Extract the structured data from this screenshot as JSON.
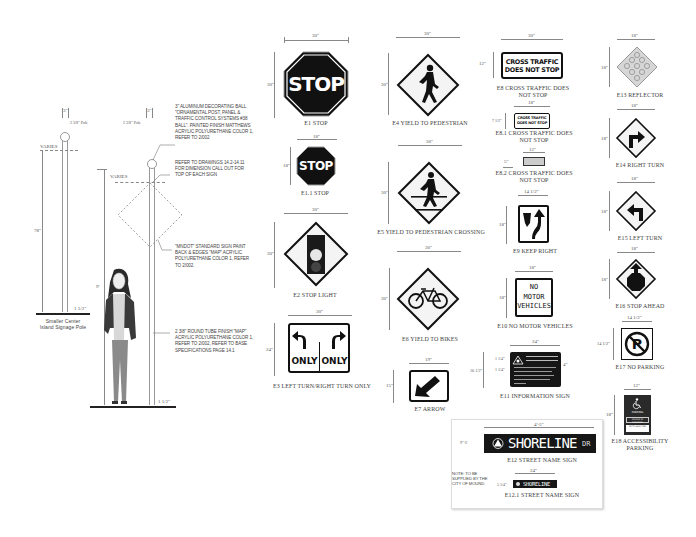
{
  "poles": {
    "small_pole": {
      "top_dim": "3\"",
      "pole_label": "2 3/8\" Pole",
      "varies": "VARIES",
      "height": "78\"",
      "base_dim": "1 1/2\"",
      "caption_line1": "Smaller Center",
      "caption_line2": "Island Signage Pole"
    },
    "large_pole": {
      "top_dim": "3\"",
      "pole_label": "2 3/8\" Pole",
      "varies": "VARIES",
      "side_dim": "9'",
      "base_dim": "1 1/2\"",
      "notes": [
        "3\" ALUMINUM DECORATING BALL \"ORNAMENTAL POST, PANEL & TRAFFIC CONTROL SYSTEMS #38 BALL\". PAINTED FINISH MATTHEWS ACRYLIC POLYURETHANE COLOR 1, REFER TO 2/002",
        "REFER TO DRAWINGS 14.2-14.11 FOR DIMENSION CALL OUT FOR TOP OF EACH SIGN",
        "\"MNDOT\" STANDARD SIGN PAINT BACK & EDGES \"MAP\" ACRYLIC POLYURETHANE COLOR 1, REFER TO 2/002.",
        "2 3/8\" ROUND TUBE FINISH \"MAP\" ACRYLIC POLYURETHANE COLOR 1, REFER TO 2/002, REFER TO BASE SPECIFICATIONS PAGE 14.1"
      ]
    }
  },
  "signs": {
    "e1": {
      "width": "30\"",
      "height": "30\"",
      "text": "STOP",
      "caption": "E1    STOP"
    },
    "e1_1": {
      "width": "18\"",
      "height": "18\"",
      "text": "STOP",
      "caption": "E1.1 STOP"
    },
    "e2": {
      "width": "30\"",
      "height": "30\"",
      "caption": "E2    STOP LIGHT"
    },
    "e3": {
      "width": "30\"",
      "height": "24\"",
      "left_text": "ONLY",
      "right_text": "ONLY",
      "caption": "E3    LEFT TURN/RIGHT TURN ONLY"
    },
    "e4": {
      "width": "30\"",
      "height": "30\"",
      "caption": "E4 YIELD TO PEDESTRIAN"
    },
    "e5": {
      "width": "30\"",
      "height": "30\"",
      "caption": "E5 YIELD TO PEDESTRIAN CROSSING"
    },
    "e6": {
      "width": "30\"",
      "height": "30\"",
      "caption": "E6 YIELD TO BIKES"
    },
    "e7": {
      "width": "19\"",
      "height": "15\"",
      "caption": "E7 ARROW"
    },
    "e8": {
      "width": "30\"",
      "height": "12\"",
      "line1": "CROSS TRAFFIC",
      "line2": "DOES NOT STOP",
      "caption_line1": "E8   CROSS TRAFFIC DOES",
      "caption_line2": "NOT STOP"
    },
    "e8_1": {
      "width": "18\"",
      "height": "7 1/2\"",
      "line1": "CROSS TRAFFIC",
      "line2": "DOES NOT STOP",
      "caption_line1": "E8.1 CROSS TRAFFIC DOES",
      "caption_line2": "NOT STOP"
    },
    "e8_2": {
      "width": "12\"",
      "height": "5\"",
      "caption_line1": "E8.2 CROSS TRAFFIC DOES",
      "caption_line2": "NOT STOP"
    },
    "e9": {
      "width": "14 1/2\"",
      "height": "18\"",
      "caption": "E9    KEEP RIGHT"
    },
    "e10": {
      "width": "18\"",
      "height": "18\"",
      "line1": "NO",
      "line2": "MOTOR",
      "line3": "VEHICLES",
      "caption": "E10 NO MOTOR VEHICLES"
    },
    "e11": {
      "width": "24\"",
      "height": "16 1/2\"",
      "dim_a": "1 1/4\"",
      "dim_b": "1 1/4\"",
      "side_dim": "4\"",
      "caption": "E11 INFORMATION SIGN"
    },
    "e12": {
      "width": "4'-5\"",
      "height": "9\" 6'",
      "street": "SHORELINE",
      "suffix": "DR",
      "caption": "E12 STREET NAME SIGN"
    },
    "e12_1": {
      "width": "24\"",
      "height": "5 1/4\"",
      "street": "SHORELINE",
      "caption": "E12.1 STREET NAME SIGN"
    },
    "e12_note": "NOTE: TO BE SUPPLIED BY THE CITY OF MOUND",
    "e13": {
      "width": "18\"",
      "height": "18\"",
      "caption": "E13 REFLECTOR"
    },
    "e14": {
      "width": "18\"",
      "height": "18\"",
      "caption": "E14 RIGHT TURN"
    },
    "e15": {
      "width": "18\"",
      "height": "18\"",
      "caption": "E15 LEFT TURN"
    },
    "e16": {
      "width": "18\"",
      "height": "18\"",
      "caption": "E16 STOP AHEAD"
    },
    "e17": {
      "width": "14 1/2\"",
      "height": "14 1/2\"",
      "caption": "E17 NO PARKING"
    },
    "e18": {
      "width": "12\"",
      "height": "18\"",
      "caption_line1": "E18  ACCESSIBILITY",
      "caption_line2": "PARKING",
      "text1": "PARKING",
      "text2": "VEHICLE ID REQUIRED",
      "text3": "UP TO $200 FINE"
    }
  },
  "colors": {
    "sign_black": "#1a1a1a",
    "sign_white": "#ffffff",
    "dim_line": "#888888",
    "caption": "#444444"
  }
}
